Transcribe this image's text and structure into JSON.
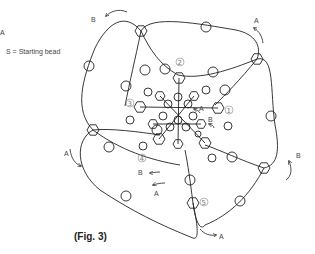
{
  "legend": {
    "a_label": "A",
    "starting_bead": "S = Starting bead"
  },
  "caption": "(Fig. 3)",
  "step_markers": [
    "①",
    "②",
    "③",
    "④",
    "⑤"
  ],
  "path_labels": {
    "A": "A",
    "B": "B",
    "S": "S"
  },
  "colors": {
    "line": "#222222",
    "text": "#444444",
    "marker": "#777777",
    "background": "#ffffff"
  }
}
